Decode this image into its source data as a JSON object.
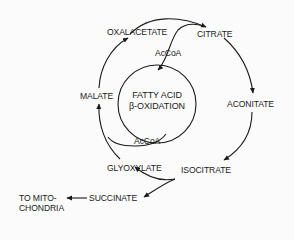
{
  "diagram": {
    "nodes": {
      "oxalacetate": "OXALACETATE",
      "citrate": "CITRATE",
      "aconitate": "ACONITATE",
      "isocitrate": "ISOCITRATE",
      "glyoxylate": "GLYOXYLATE",
      "malate": "MALATE",
      "succinate": "SUCCINATE",
      "acetyl_coa_top": "AcCoA",
      "acetyl_coa_bottom": "AcCoA",
      "center_line1": "FATTY ACID",
      "center_line2": "β-OXIDATION",
      "destination_line1": "TO MITO-",
      "destination_line2": "CHONDRIA"
    },
    "edges": [
      {
        "from": "OXALACETATE",
        "to": "CITRATE"
      },
      {
        "from": "AcCoA",
        "to": "CITRATE"
      },
      {
        "from": "CITRATE",
        "to": "ACONITATE"
      },
      {
        "from": "ACONITATE",
        "to": "ISOCITRATE"
      },
      {
        "from": "ISOCITRATE",
        "to": "GLYOXYLATE"
      },
      {
        "from": "ISOCITRATE",
        "to": "SUCCINATE"
      },
      {
        "from": "SUCCINATE",
        "to": "TO MITOCHONDRIA"
      },
      {
        "from": "GLYOXYLATE",
        "to": "MALATE"
      },
      {
        "from": "AcCoA",
        "to": "MALATE"
      },
      {
        "from": "MALATE",
        "to": "OXALACETATE"
      },
      {
        "from": "FATTY ACID β-OXIDATION",
        "to": "AcCoA"
      }
    ],
    "colors": {
      "ink": "#1a1a1a",
      "background": "#fbfbfb"
    }
  }
}
